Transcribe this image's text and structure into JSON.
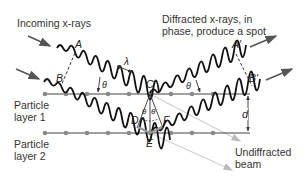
{
  "labels": {
    "incoming": "Incoming x-rays",
    "diffracted_line1": "Diffracted x-rays, in",
    "diffracted_line2": "phase, produce a spot",
    "layer1_line1": "Particle",
    "layer1_line2": "layer 1",
    "layer2_line1": "Particle",
    "layer2_line2": "layer 2",
    "undiffracted_line1": "Undiffracted",
    "undiffracted_line2": "beam"
  },
  "points": {
    "A": "A",
    "B": "B",
    "C": "C",
    "D": "D",
    "E": "E",
    "F": "F",
    "A_prime": "A′",
    "B_prime": "B′"
  },
  "symbols": {
    "wavelength": "λ",
    "theta": "θ",
    "spacing": "d"
  },
  "colors": {
    "wave": "#111111",
    "arrow": "#555555",
    "layer_line": "#444444",
    "particle": "#8a8a8a",
    "undiffracted": "#c8c8c8",
    "label_text": "#333333"
  }
}
